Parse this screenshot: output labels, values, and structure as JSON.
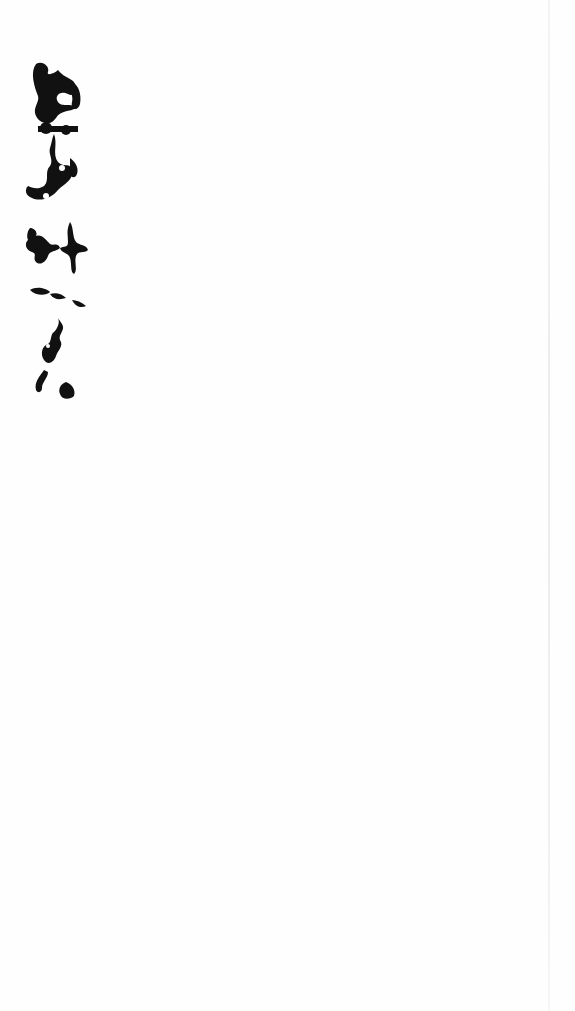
{
  "document": {
    "type": "scanned page",
    "background_color": "#fefefe",
    "ink_color": "#111111",
    "right_edge_line_color": "#ececec",
    "signature_block": {
      "description": "cursive handwritten signature (vertical)",
      "position": "top-left"
    },
    "vertical_text": {
      "description": "vertical handwritten characters, faded ink",
      "approx_glyph_count": 4
    }
  }
}
